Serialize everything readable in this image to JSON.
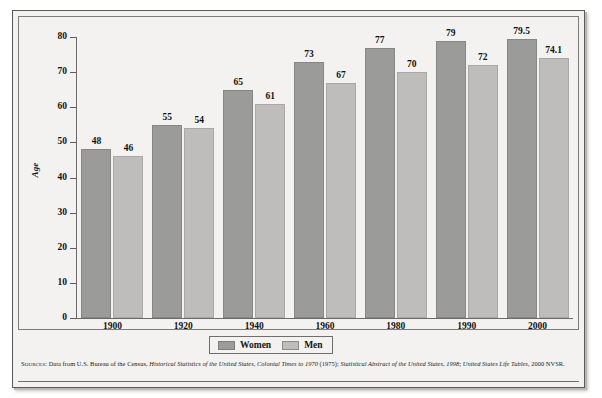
{
  "chart_data": {
    "type": "bar",
    "title": "",
    "xlabel": "",
    "ylabel": "Age",
    "ylim": [
      0,
      80
    ],
    "ytick_step": 10,
    "yticks": [
      80,
      70,
      60,
      50,
      40,
      30,
      20,
      10,
      0
    ],
    "categories": [
      "1900",
      "1920",
      "1940",
      "1960",
      "1980",
      "1990",
      "2000"
    ],
    "grid": false,
    "legend_position": "bottom-center",
    "series": [
      {
        "name": "Women",
        "color": "#9b9b99",
        "values": [
          48,
          55,
          65,
          73,
          77,
          79,
          79.5
        ],
        "labels": [
          "48",
          "55",
          "65",
          "73",
          "77",
          "79",
          "79.5"
        ]
      },
      {
        "name": "Men",
        "color": "#bebdbb",
        "values": [
          46,
          54,
          61,
          67,
          70,
          72,
          74.1
        ],
        "labels": [
          "46",
          "54",
          "61",
          "67",
          "70",
          "72",
          "74.1"
        ]
      }
    ]
  },
  "legend": {
    "items": [
      {
        "label": "Women"
      },
      {
        "label": "Men"
      }
    ]
  },
  "source": {
    "label": "Sources:",
    "part1": " Data from U.S. Bureau of the Census, ",
    "italic1": "Historical Statistics of the United States, Colonial Times to 1970",
    "part2": " (1975); ",
    "italic2": "Statistical Abstract of the United States, 1998",
    "part3": "; ",
    "italic3": "United States Life Tables",
    "part4": ", 2000 NVSR."
  },
  "colors": {
    "women_bar": "#9b9b99",
    "men_bar": "#bebdbb",
    "background": "#f3f2f0",
    "frame": "#5a5a58",
    "text": "#131313"
  }
}
